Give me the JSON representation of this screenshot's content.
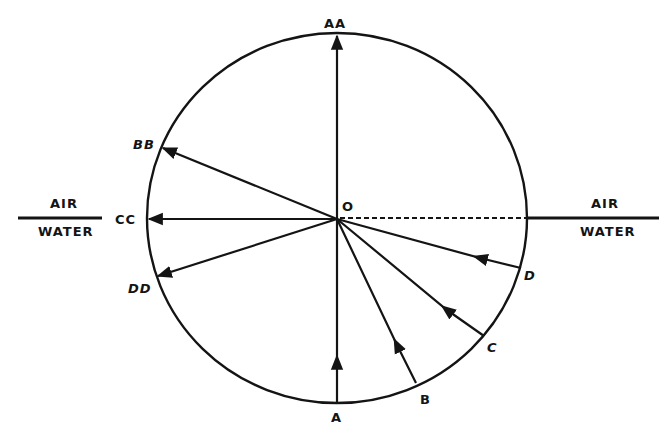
{
  "diagram": {
    "colors": {
      "ink": "#141414",
      "background": "#ffffff"
    },
    "center": {
      "label": "O"
    },
    "boundary": {
      "left": {
        "upper": "AIR",
        "lower": "WATER"
      },
      "right": {
        "upper": "AIR",
        "lower": "WATER"
      }
    },
    "incident_rays": [
      {
        "label": "A"
      },
      {
        "label": "B"
      },
      {
        "label": "C"
      },
      {
        "label": "D"
      }
    ],
    "refracted_rays": [
      {
        "label": "AA"
      },
      {
        "label": "BB"
      },
      {
        "label": "CC"
      },
      {
        "label": "DD"
      }
    ]
  }
}
